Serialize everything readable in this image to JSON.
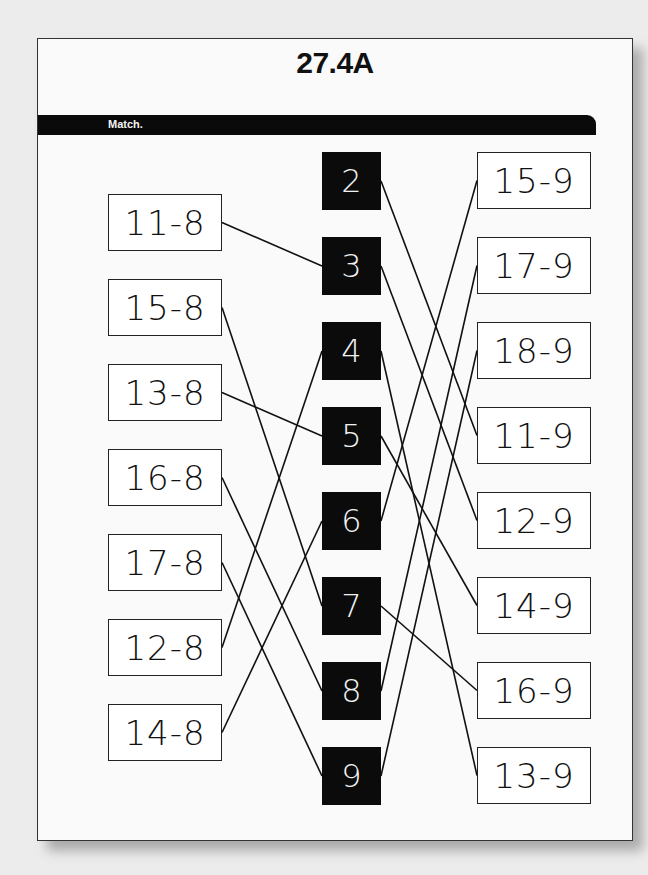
{
  "worksheet": {
    "title": "27.4A",
    "instruction": "Match.",
    "left_expressions": [
      "11-8",
      "15-8",
      "13-8",
      "16-8",
      "17-8",
      "12-8",
      "14-8"
    ],
    "answers": [
      "2",
      "3",
      "4",
      "5",
      "6",
      "7",
      "8",
      "9"
    ],
    "right_expressions": [
      "15-9",
      "17-9",
      "18-9",
      "11-9",
      "12-9",
      "14-9",
      "16-9",
      "13-9"
    ],
    "left_matches": [
      {
        "expr": "11-8",
        "answer": "3"
      },
      {
        "expr": "15-8",
        "answer": "7"
      },
      {
        "expr": "13-8",
        "answer": "5"
      },
      {
        "expr": "16-8",
        "answer": "8"
      },
      {
        "expr": "17-8",
        "answer": "9"
      },
      {
        "expr": "12-8",
        "answer": "4"
      },
      {
        "expr": "14-8",
        "answer": "6"
      }
    ],
    "right_matches": [
      {
        "expr": "15-9",
        "answer": "6"
      },
      {
        "expr": "17-9",
        "answer": "8"
      },
      {
        "expr": "18-9",
        "answer": "9"
      },
      {
        "expr": "11-9",
        "answer": "2"
      },
      {
        "expr": "12-9",
        "answer": "3"
      },
      {
        "expr": "14-9",
        "answer": "5"
      },
      {
        "expr": "16-9",
        "answer": "7"
      },
      {
        "expr": "13-9",
        "answer": "4"
      }
    ]
  },
  "colors": {
    "answer_box": "#0b0b0b",
    "bar": "#0a0a0a",
    "line": "#111111"
  }
}
